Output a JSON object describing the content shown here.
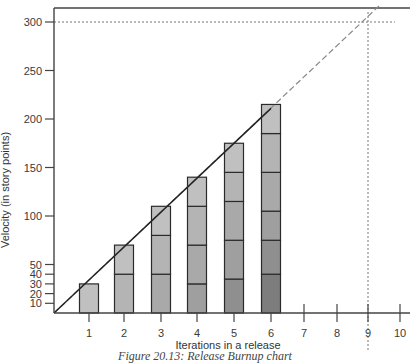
{
  "chart_data": {
    "type": "bar",
    "subtype": "stacked-bar with trend line (release burnup)",
    "title": "",
    "xlabel": "Iterations in a release",
    "ylabel": "Velocity (in story points)",
    "x_ticks": [
      "1",
      "2",
      "3",
      "4",
      "5",
      "6",
      "7",
      "8",
      "9",
      "10"
    ],
    "y_ticks": [
      10,
      20,
      30,
      40,
      50,
      100,
      150,
      200,
      250,
      300
    ],
    "ylim": [
      0,
      300
    ],
    "xlim": [
      0,
      10
    ],
    "grid": false,
    "categories": [
      "1",
      "2",
      "3",
      "4",
      "5",
      "6"
    ],
    "stacks": [
      [
        30
      ],
      [
        40,
        30
      ],
      [
        40,
        40,
        30
      ],
      [
        30,
        40,
        40,
        30
      ],
      [
        35,
        40,
        40,
        30,
        30
      ],
      [
        40,
        35,
        30,
        40,
        40,
        30
      ]
    ],
    "totals": [
      30,
      70,
      110,
      140,
      175,
      215
    ],
    "segment_shades": [
      "#7d7d7d",
      "#8f8f8f",
      "#9f9f9f",
      "#a9a9a9",
      "#b4b4b4",
      "#c0c0c0"
    ],
    "trend_line": {
      "style": "solid",
      "from": [
        0,
        0
      ],
      "to": [
        6,
        211
      ]
    },
    "projection_line": {
      "style": "dashed",
      "from": [
        0,
        0
      ],
      "to": [
        9.4,
        318
      ]
    },
    "reference_lines": [
      {
        "orientation": "horizontal",
        "value": 300,
        "style": "dotted",
        "label": "release scope"
      },
      {
        "orientation": "vertical",
        "value": 9,
        "style": "dotted",
        "label": "projected completion iteration"
      }
    ],
    "legend": null
  },
  "caption": "Figure 20.13: Release Burnup chart"
}
